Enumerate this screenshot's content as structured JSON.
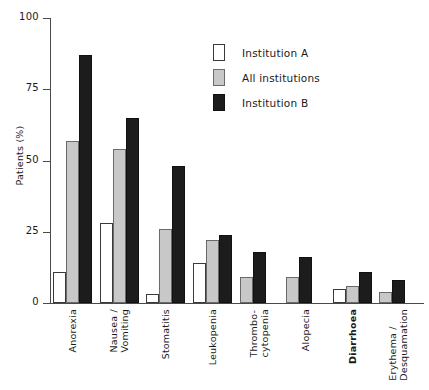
{
  "chart_data": {
    "type": "bar",
    "title": "",
    "xlabel": "",
    "ylabel": "Patients (%)",
    "ylim": [
      0,
      100
    ],
    "yticks": [
      0,
      25,
      50,
      75,
      100
    ],
    "grid": false,
    "legend_position": "upper-right",
    "categories": [
      "Anorexia",
      "Nausea /\nVomiting",
      "Stomatitis",
      "Leukopenia",
      "Thrombo-\ncytopenia",
      "Alopecia",
      "Diarrhoea",
      "Erythema /\nDesquamation"
    ],
    "series": [
      {
        "name": "Institution A",
        "color": "#ffffff",
        "values": [
          11,
          28,
          3,
          14,
          0,
          0,
          5,
          0
        ]
      },
      {
        "name": "All institutions",
        "color": "#c8c8c8",
        "values": [
          57,
          54,
          26,
          22,
          9,
          9,
          6,
          4
        ]
      },
      {
        "name": "Institution B",
        "color": "#1c1c1c",
        "values": [
          87,
          65,
          48,
          24,
          18,
          16,
          11,
          8
        ]
      }
    ]
  },
  "axis": {
    "y_title": "Patients (%)",
    "y_tick_labels": [
      "100",
      "75",
      "50",
      "25",
      "0"
    ]
  },
  "legend": {
    "items": [
      {
        "label": "Institution A",
        "swatch": "white-square-icon"
      },
      {
        "label": "All institutions",
        "swatch": "gray-square-icon"
      },
      {
        "label": "Institution B",
        "swatch": "black-square-icon"
      }
    ]
  },
  "x_labels": [
    {
      "lines": [
        "Anorexia"
      ],
      "bold": false
    },
    {
      "lines": [
        "Nausea /",
        "Vomiting"
      ],
      "bold": false
    },
    {
      "lines": [
        "Stomatitis"
      ],
      "bold": false
    },
    {
      "lines": [
        "Leukopenia"
      ],
      "bold": false
    },
    {
      "lines": [
        "Thrombo-",
        "cytopenia"
      ],
      "bold": false
    },
    {
      "lines": [
        "Alopecia"
      ],
      "bold": false
    },
    {
      "lines": [
        "Diarrhoea"
      ],
      "bold": true
    },
    {
      "lines": [
        "Erythema /",
        "Desquamation"
      ],
      "bold": false
    }
  ]
}
